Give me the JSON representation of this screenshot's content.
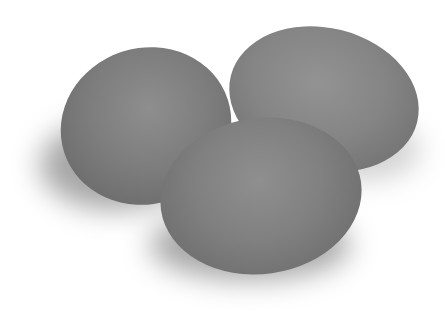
{
  "image": {
    "subject": "three gray eggs on white background",
    "colors": {
      "background": "#ffffff",
      "egg": "#7f7f7f"
    },
    "objects": [
      {
        "name": "egg",
        "position": "left"
      },
      {
        "name": "egg",
        "position": "right"
      },
      {
        "name": "egg",
        "position": "front"
      }
    ]
  }
}
